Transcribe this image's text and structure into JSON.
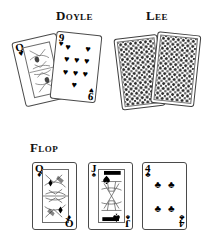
{
  "scene": {
    "background_color": "#ffffff",
    "width": 212,
    "height": 240,
    "description": "Texas hold'em illustration showing two player hands and the flop"
  },
  "sections": [
    {
      "id": "doyle",
      "heading": "Doyle",
      "hand_type": "face-up",
      "cards": [
        {
          "rank": "Q",
          "suit": "hearts",
          "suit_symbol": "♥",
          "label": "Queen of Hearts",
          "color": "#000000",
          "is_court": true
        },
        {
          "rank": "9",
          "suit": "hearts",
          "suit_symbol": "♥",
          "label": "Nine of Hearts",
          "color": "#000000",
          "pip_count": 9
        }
      ]
    },
    {
      "id": "lee",
      "heading": "Lee",
      "hand_type": "face-down",
      "cards": [
        {
          "rank": "",
          "suit": "back",
          "label": "Face-down card",
          "back_pattern": "diamond-lattice"
        },
        {
          "rank": "",
          "suit": "back",
          "label": "Face-down card",
          "back_pattern": "diamond-lattice"
        }
      ]
    },
    {
      "id": "flop",
      "heading": "Flop",
      "hand_type": "face-up",
      "cards": [
        {
          "rank": "Q",
          "suit": "diamonds",
          "suit_symbol": "♦",
          "label": "Queen of Diamonds",
          "color": "#000000",
          "is_court": true
        },
        {
          "rank": "J",
          "suit": "spades",
          "suit_symbol": "♠",
          "label": "Jack of Spades",
          "color": "#000000",
          "is_court": true
        },
        {
          "rank": "4",
          "suit": "clubs",
          "suit_symbol": "♣",
          "label": "Four of Clubs",
          "color": "#000000",
          "pip_count": 4
        }
      ]
    }
  ],
  "headings": {
    "doyle": "Doyle",
    "lee": "Lee",
    "flop": "Flop"
  },
  "pips": {
    "heart": "♥",
    "club": "♣",
    "spade": "♠",
    "diamond": "♦"
  },
  "colors": {
    "ink": "#000000",
    "card_border": "#4a4a4a",
    "back_pattern": "#2b2b2b",
    "paper": "#ffffff"
  }
}
